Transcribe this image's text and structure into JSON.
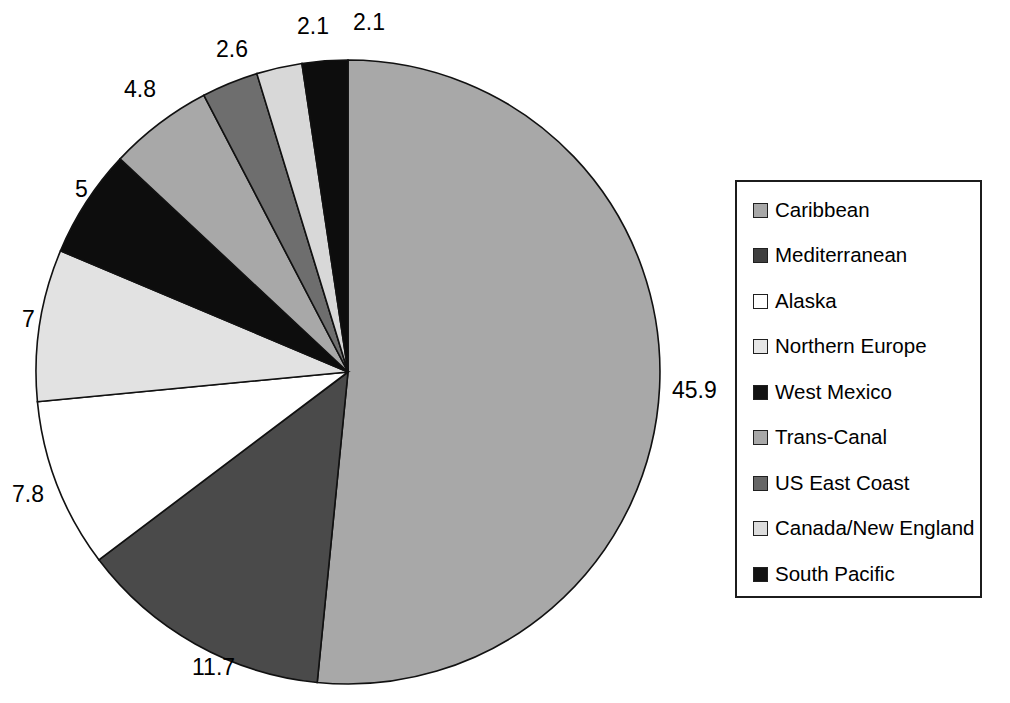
{
  "chart_data": {
    "type": "pie",
    "title": "",
    "subtitle": "",
    "xlabel": "",
    "ylabel": "",
    "grid": false,
    "legend_position": "right",
    "units": "percent",
    "total": 99.0,
    "categories": [
      "Caribbean",
      "Mediterranean",
      "Alaska",
      "Northern Europe",
      "West Mexico",
      "Trans-Canal",
      "US East Coast",
      "Canada/New England",
      "South Pacific"
    ],
    "values": [
      45.9,
      11.7,
      7.8,
      7,
      5,
      4.8,
      2.6,
      2.1,
      2.1
    ],
    "data_labels": [
      "45.9",
      "11.7",
      "7.8",
      "7",
      "5",
      "4.8",
      "2.6",
      "2.1",
      "2.1"
    ],
    "slice_colors": [
      "#a8a8a8",
      "#4a4a4a",
      "#ffffff",
      "#e2e2e2",
      "#0d0d0d",
      "#a8a8a8",
      "#6e6e6e",
      "#d8d8d8",
      "#0d0d0d"
    ]
  },
  "legend": {
    "items": [
      {
        "label": "Caribbean",
        "color": "#a8a8a8"
      },
      {
        "label": "Mediterranean",
        "color": "#3f3f3f"
      },
      {
        "label": "Alaska",
        "color": "#ffffff"
      },
      {
        "label": "Northern Europe",
        "color": "#e6e6e6"
      },
      {
        "label": "West Mexico",
        "color": "#121212"
      },
      {
        "label": "Trans-Canal",
        "color": "#a8a8a8"
      },
      {
        "label": "US East Coast",
        "color": "#666666"
      },
      {
        "label": "Canada/New England",
        "color": "#dcdcdc"
      },
      {
        "label": "South Pacific",
        "color": "#121212"
      }
    ]
  },
  "labels": [
    {
      "text": "45.9",
      "x": 672,
      "y": 377,
      "name": "data-label-caribbean"
    },
    {
      "text": "11.7",
      "x": 192,
      "y": 654,
      "name": "data-label-mediterranean"
    },
    {
      "text": "7.8",
      "x": 12,
      "y": 481,
      "name": "data-label-alaska"
    },
    {
      "text": "7",
      "x": 22,
      "y": 306,
      "name": "data-label-northern-europe"
    },
    {
      "text": "5",
      "x": 75,
      "y": 176,
      "name": "data-label-west-mexico"
    },
    {
      "text": "4.8",
      "x": 124,
      "y": 76,
      "name": "data-label-trans-canal"
    },
    {
      "text": "2.6",
      "x": 216,
      "y": 36,
      "name": "data-label-us-east-coast"
    },
    {
      "text": "2.1",
      "x": 297,
      "y": 13,
      "name": "data-label-canada-new-england"
    },
    {
      "text": "2.1",
      "x": 353,
      "y": 9,
      "name": "data-label-south-pacific"
    }
  ],
  "geometry": {
    "cx": 348,
    "cy": 372,
    "r": 312,
    "start_angle_deg": -90,
    "direction": "clockwise",
    "stroke": "#111111"
  }
}
